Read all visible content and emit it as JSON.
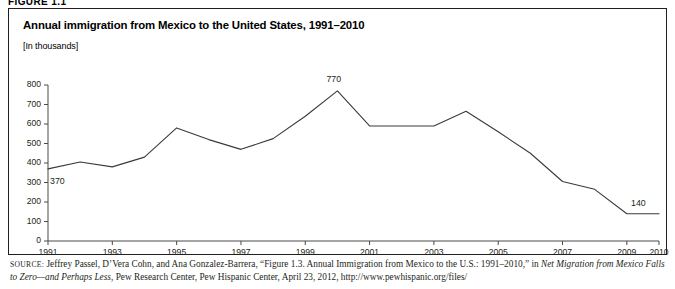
{
  "figure": {
    "tag": "FIGURE 1.1",
    "title": "Annual immigration from Mexico to the United States, 1991–2010",
    "units": "[In thousands]"
  },
  "source": {
    "label": "SOURCE:",
    "text_part1": " Jeffrey Passel, D’Vera Cohn, and Ana Gonzalez-Barrera, “Figure 1.3. Annual Immigration from Mexico to the U.S.: 1991–2010,” in ",
    "italic1": "Net Migration from Mexico Falls to Zero—and Perhaps Less",
    "text_part2": ", Pew Research Center, Pew Hispanic Center, April 23, 2012, http://www.pewhispanic.org/files/"
  },
  "chart_data": {
    "type": "line",
    "title": "Annual immigration from Mexico to the United States, 1991–2010",
    "xlabel": "",
    "ylabel": "",
    "units": "[In thousands]",
    "grid": false,
    "legend": "none",
    "line_color": "#3a3a3a",
    "x": [
      1991,
      1992,
      1993,
      1994,
      1995,
      1996,
      1997,
      1998,
      1999,
      2000,
      2001,
      2002,
      2003,
      2004,
      2005,
      2006,
      2007,
      2008,
      2009,
      2010
    ],
    "values": [
      370,
      405,
      380,
      430,
      580,
      520,
      470,
      525,
      640,
      770,
      590,
      590,
      590,
      665,
      560,
      450,
      305,
      265,
      140,
      140
    ],
    "xlim": [
      1991,
      2010
    ],
    "ylim": [
      0,
      800
    ],
    "yticks": [
      0,
      100,
      200,
      300,
      400,
      500,
      600,
      700,
      800
    ],
    "ytick_labels": [
      "0",
      "100",
      "200",
      "300",
      "400",
      "500",
      "600",
      "700",
      "800"
    ],
    "xticks": [
      1991,
      1993,
      1995,
      1997,
      1999,
      2001,
      2003,
      2005,
      2007,
      2009,
      2010
    ],
    "xtick_labels": [
      "1991",
      "1993",
      "1995",
      "1997",
      "1999",
      "2001",
      "2003",
      "2005",
      "2007",
      "2009",
      "2010"
    ],
    "annotations": [
      {
        "label": "370",
        "x": 1991,
        "y": 370,
        "position": "below-right"
      },
      {
        "label": "770",
        "x": 2000,
        "y": 770,
        "position": "above"
      },
      {
        "label": "140",
        "x": 2010,
        "y": 140,
        "position": "above-left"
      }
    ]
  }
}
